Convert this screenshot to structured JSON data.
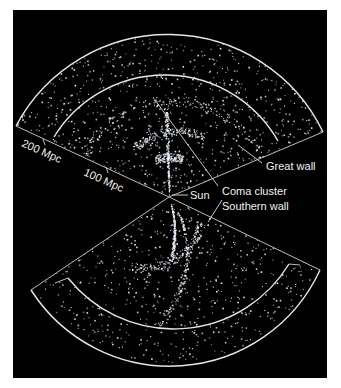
{
  "figure": {
    "type": "galaxy redshift survey wedge diagram",
    "background_color": "#000000",
    "point_color": "#e8eef5",
    "line_color": "#e6e6e6"
  },
  "scale": {
    "ticks": [
      {
        "label": "200 Mpc"
      },
      {
        "label": "100 Mpc"
      }
    ]
  },
  "annotations": [
    {
      "id": "great-wall",
      "label": "Great wall"
    },
    {
      "id": "sun",
      "label": "Sun"
    },
    {
      "id": "coma-cluster",
      "label": "Coma cluster"
    },
    {
      "id": "southern-wall",
      "label": "Southern wall"
    }
  ]
}
